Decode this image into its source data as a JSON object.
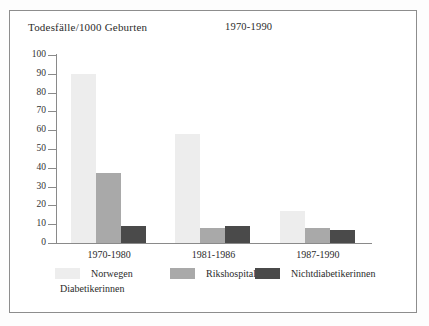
{
  "chart_data": {
    "type": "bar",
    "title": "",
    "ylabel": "Todesfälle/1000 Geburten",
    "period": "1970-1990",
    "xlabel": "",
    "categories": [
      "1970-1980",
      "1981-1986",
      "1987-1990"
    ],
    "ylim": [
      0,
      100
    ],
    "yticks": [
      0,
      10,
      20,
      30,
      40,
      50,
      60,
      70,
      80,
      90,
      100
    ],
    "ytick_labels": [
      "0",
      "10",
      "20",
      "30",
      "40",
      "50",
      "60",
      "70",
      "80",
      "90",
      "100"
    ],
    "grid": false,
    "legend_position": "bottom",
    "series": [
      {
        "name": "Norwegen",
        "color": "#ededed",
        "values": [
          90,
          58,
          17
        ]
      },
      {
        "name": "Rikshospitalet",
        "color": "#a9a9a9",
        "values": [
          37,
          8,
          8
        ]
      },
      {
        "name": "Nichtdiabetikerinnen",
        "color": "#4a4a4a",
        "values": [
          9,
          9,
          7
        ]
      }
    ],
    "legend_subtitle": "Diabetikerinnen",
    "annotations": []
  },
  "colors": {
    "series_light": "#ededed",
    "series_mid": "#a9a9a9",
    "series_dark": "#4a4a4a",
    "axis": "#8a8a8a",
    "frame": "#8d8d8d",
    "text": "#2b2b2b",
    "background": "#ffffff"
  }
}
